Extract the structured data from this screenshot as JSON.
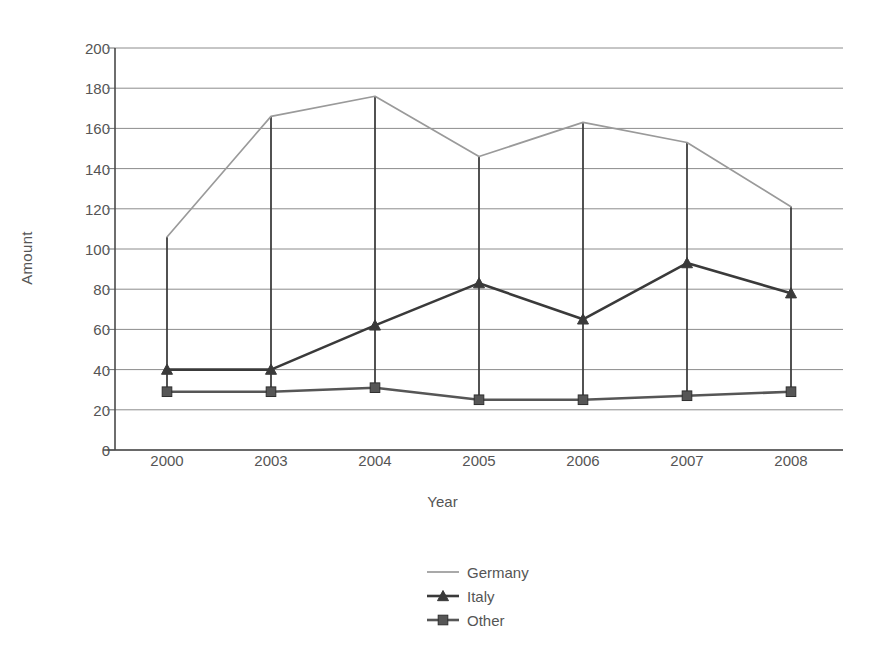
{
  "chart_data": {
    "type": "line",
    "title": "",
    "xlabel": "Year",
    "ylabel": "Amount",
    "categories": [
      "2000",
      "2003",
      "2004",
      "2005",
      "2006",
      "2007",
      "2008"
    ],
    "ylim": [
      0,
      200
    ],
    "yticks": [
      0,
      20,
      40,
      60,
      80,
      100,
      120,
      140,
      160,
      180,
      200
    ],
    "ytick_labels": [
      "0",
      "20",
      "40",
      "60",
      "80",
      "100",
      "120",
      "140",
      "160",
      "180",
      "200"
    ],
    "grid": "horizontal",
    "legend_position": "bottom-center",
    "drop_lines": true,
    "series": [
      {
        "name": "Germany",
        "color": "#9a9a9a",
        "marker": "none",
        "values": [
          106,
          166,
          176,
          146,
          163,
          153,
          121
        ]
      },
      {
        "name": "Italy",
        "color": "#3a3a3a",
        "marker": "triangle",
        "values": [
          40,
          40,
          62,
          83,
          65,
          93,
          78
        ]
      },
      {
        "name": "Other",
        "color": "#565656",
        "marker": "square",
        "values": [
          29,
          29,
          31,
          25,
          25,
          27,
          29
        ]
      }
    ]
  },
  "legend": {
    "items": [
      {
        "label": "Germany"
      },
      {
        "label": "Italy"
      },
      {
        "label": "Other"
      }
    ]
  }
}
